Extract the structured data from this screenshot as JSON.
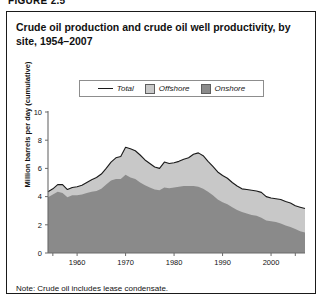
{
  "figure_label": "FIGURE 2.5",
  "title": "Crude oil production and crude oil well productivity, by site, 1954–2007",
  "note": "Note:  Crude oil includes lease condensate.",
  "legend": {
    "items": [
      {
        "label": "Total",
        "marker": "line",
        "color": "#1a1a1a"
      },
      {
        "label": "Offshore",
        "marker": "swatch",
        "color": "#c8c8c8"
      },
      {
        "label": "Onshore",
        "marker": "swatch",
        "color": "#8a8a8a"
      }
    ]
  },
  "chart_data": {
    "type": "area",
    "stacked": true,
    "title": "Crude oil production and crude oil well productivity, by site, 1954–2007",
    "xlabel": "",
    "ylabel": "Million barrels per day (cumulative)",
    "xlim": [
      1954,
      2007
    ],
    "ylim": [
      0,
      10
    ],
    "yticks": [
      0,
      2,
      4,
      6,
      8,
      10
    ],
    "xticks": [
      1960,
      1970,
      1980,
      1990,
      2000
    ],
    "grid": false,
    "legend_position": "top-center",
    "x": [
      1954,
      1955,
      1956,
      1957,
      1958,
      1959,
      1960,
      1961,
      1962,
      1963,
      1964,
      1965,
      1966,
      1967,
      1968,
      1969,
      1970,
      1971,
      1972,
      1973,
      1974,
      1975,
      1976,
      1977,
      1978,
      1979,
      1980,
      1981,
      1982,
      1983,
      1984,
      1985,
      1986,
      1987,
      1988,
      1989,
      1990,
      1991,
      1992,
      1993,
      1994,
      1995,
      1996,
      1997,
      1998,
      1999,
      2000,
      2001,
      2002,
      2003,
      2004,
      2005,
      2006,
      2007
    ],
    "series": [
      {
        "name": "Onshore",
        "values": [
          3.95,
          4.15,
          4.35,
          4.25,
          3.95,
          4.1,
          4.1,
          4.15,
          4.25,
          4.35,
          4.4,
          4.55,
          4.85,
          5.15,
          5.25,
          5.25,
          5.55,
          5.35,
          5.25,
          5.0,
          4.8,
          4.65,
          4.5,
          4.45,
          4.65,
          4.6,
          4.65,
          4.7,
          4.75,
          4.75,
          4.75,
          4.7,
          4.55,
          4.35,
          4.1,
          3.8,
          3.6,
          3.45,
          3.25,
          3.05,
          2.9,
          2.8,
          2.7,
          2.65,
          2.5,
          2.3,
          2.25,
          2.2,
          2.1,
          1.95,
          1.85,
          1.7,
          1.55,
          1.45
        ]
      },
      {
        "name": "Offshore",
        "values": [
          0.4,
          0.4,
          0.5,
          0.6,
          0.55,
          0.55,
          0.6,
          0.65,
          0.75,
          0.85,
          0.95,
          1.05,
          1.15,
          1.3,
          1.5,
          1.6,
          1.95,
          2.05,
          2.0,
          1.95,
          1.8,
          1.7,
          1.6,
          1.55,
          1.8,
          1.75,
          1.75,
          1.8,
          1.9,
          2.0,
          2.25,
          2.4,
          2.35,
          2.15,
          2.05,
          1.95,
          1.9,
          1.85,
          1.75,
          1.7,
          1.65,
          1.7,
          1.75,
          1.75,
          1.8,
          1.7,
          1.65,
          1.65,
          1.7,
          1.7,
          1.7,
          1.65,
          1.7,
          1.7
        ]
      }
    ],
    "total": [
      4.35,
      4.55,
      4.85,
      4.85,
      4.5,
      4.65,
      4.7,
      4.8,
      5.0,
      5.2,
      5.35,
      5.6,
      6.0,
      6.45,
      6.75,
      6.85,
      7.5,
      7.4,
      7.25,
      6.95,
      6.6,
      6.35,
      6.1,
      6.0,
      6.45,
      6.35,
      6.4,
      6.5,
      6.65,
      6.75,
      7.0,
      7.1,
      6.9,
      6.5,
      6.15,
      5.75,
      5.5,
      5.3,
      5.0,
      4.75,
      4.55,
      4.5,
      4.45,
      4.4,
      4.3,
      4.0,
      3.9,
      3.85,
      3.8,
      3.65,
      3.55,
      3.35,
      3.25,
      3.15
    ]
  },
  "axis": {
    "y_tick_labels": [
      "0",
      "2",
      "4",
      "6",
      "8",
      "10"
    ],
    "x_tick_labels": [
      "1960",
      "1970",
      "1980",
      "1990",
      "2000"
    ]
  },
  "colors": {
    "offshore": "#c8c8c8",
    "onshore": "#8a8a8a",
    "line": "#1a1a1a",
    "axis": "#6a6a6a",
    "frame": "#1a1a1a"
  }
}
